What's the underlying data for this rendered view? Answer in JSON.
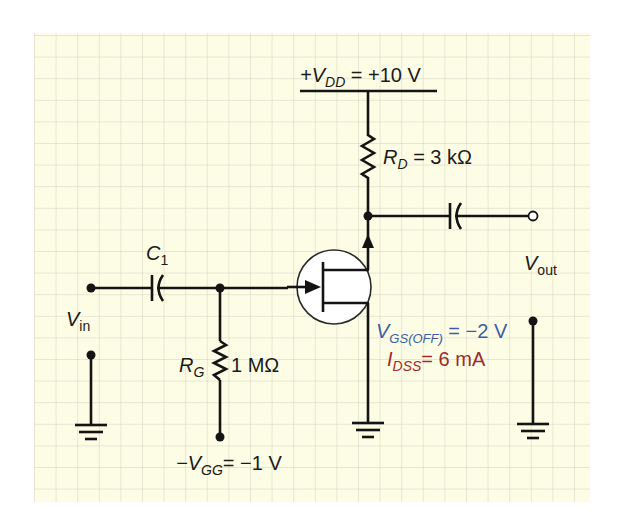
{
  "colors": {
    "background": "#fdfde6",
    "grid": "#cfcfc0",
    "wire": "#141414",
    "param_blue": "#3b5ea8",
    "param_red": "#9c2b2b"
  },
  "grid": {
    "x0": 34,
    "y0": 33,
    "x1": 590,
    "y1": 502,
    "spacing": 21.6
  },
  "labels": {
    "vdd": {
      "prefix": "+V",
      "sub": "DD",
      "value": " = +10 V"
    },
    "rd": {
      "name": "R",
      "sub": "D",
      "value": " = 3 kΩ"
    },
    "c1": {
      "name": "C",
      "sub": "1"
    },
    "vin": {
      "name": "V",
      "sub": "in"
    },
    "vout": {
      "name": "V",
      "sub": "out"
    },
    "rg": {
      "name": "R",
      "sub": "G",
      "value": "1 MΩ"
    },
    "vgg": {
      "prefix": "−V",
      "sub": "GG",
      "value": "= −1 V"
    },
    "vgsoff": {
      "name": "V",
      "sub": "GS(OFF)",
      "value": " = −2 V"
    },
    "idss": {
      "name": "I",
      "sub": "DSS",
      "value": "= 6 mA"
    }
  },
  "components": {
    "supply": "VDD = +10 V",
    "drain_resistor": "RD = 3 kΩ",
    "input_capacitor": "C1",
    "gate_resistor": "RG = 1 MΩ",
    "gate_bias": "−VGG = −1 V",
    "transistor": "n-channel JFET",
    "output_capacitor": "unlabeled",
    "jfet_params": [
      "VGS(OFF) = −2 V",
      "IDSS = 6 mA"
    ]
  }
}
